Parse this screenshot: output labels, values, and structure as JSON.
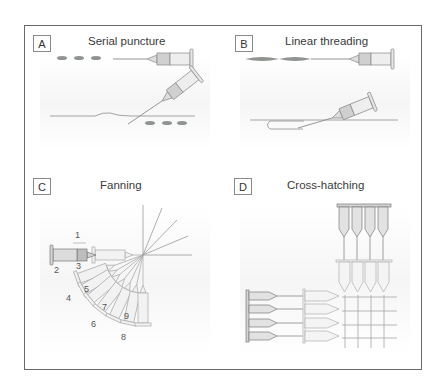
{
  "figure": {
    "panels": [
      {
        "id": "A",
        "label": "A",
        "title": "Serial puncture"
      },
      {
        "id": "B",
        "label": "B",
        "title": "Linear threading"
      },
      {
        "id": "C",
        "label": "C",
        "title": "Fanning",
        "step_numbers": [
          "1",
          "2",
          "3",
          "4",
          "5",
          "6",
          "7",
          "8",
          "9"
        ]
      },
      {
        "id": "D",
        "label": "D",
        "title": "Cross-hatching"
      }
    ]
  },
  "colors": {
    "frame": "#6a6a6a",
    "filler_deposit": "#8f9490",
    "syringe_outline": "#8a8a8a",
    "syringe_fill": "#e4e4e4",
    "hub_fill": "#c9c9c9",
    "skin_line": "#9a9a9a"
  }
}
